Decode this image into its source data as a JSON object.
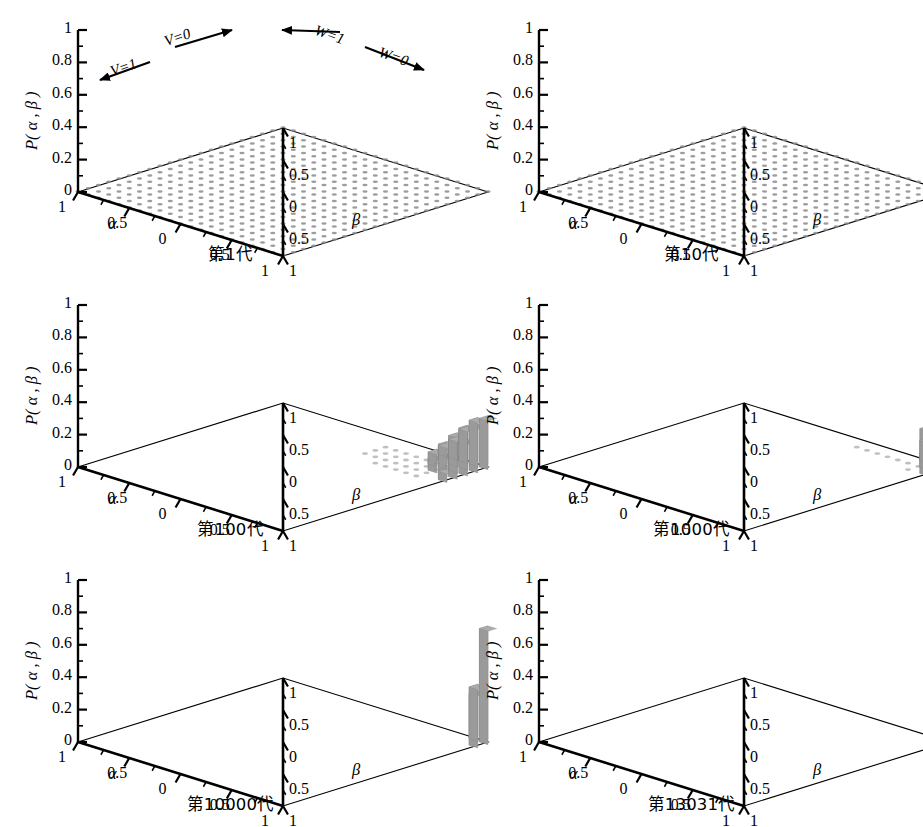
{
  "figure": {
    "type": "multi-panel-3d-surface-grid",
    "panel_count": 6,
    "columns": 2,
    "rows": 3,
    "background": "#ffffff",
    "ink_color": "#000000",
    "data_color": "#8c8c8c"
  },
  "axes": {
    "z_label": "P( α , β )",
    "z_ticks": [
      "0",
      "0.2",
      "0.4",
      "0.6",
      "0.8",
      "1"
    ],
    "z_values": [
      0,
      0.2,
      0.4,
      0.6,
      0.8,
      1
    ],
    "z_range": [
      0,
      1
    ],
    "alpha_label": "α",
    "alpha_ticks": [
      "1",
      "0.5",
      "0",
      "0.5",
      "1"
    ],
    "beta_label": "β",
    "beta_ticks": [
      "1",
      "0.5",
      "0",
      "0.5",
      "1"
    ]
  },
  "annotations": {
    "v1": "V=1",
    "v0": "V=0",
    "w1": "W=1",
    "w0": "W=0"
  },
  "panels": [
    {
      "id": "gen1",
      "caption": "第1代",
      "generation": 1,
      "has_annotations": true,
      "mode": "uniform-grid",
      "peak": 0.0
    },
    {
      "id": "gen10",
      "caption": "第10代",
      "generation": 10,
      "has_annotations": false,
      "mode": "uniform-grid",
      "peak": 0.0
    },
    {
      "id": "gen100",
      "caption": "第100代",
      "generation": 100,
      "has_annotations": false,
      "mode": "spike",
      "peak": 0.3
    },
    {
      "id": "gen1000",
      "caption": "第1000代",
      "generation": 1000,
      "has_annotations": false,
      "mode": "spike",
      "peak": 0.45
    },
    {
      "id": "gen10000",
      "caption": "第10000代",
      "generation": 10000,
      "has_annotations": false,
      "mode": "spike",
      "peak": 0.7
    },
    {
      "id": "gen13031",
      "caption": "第13031代",
      "generation": 13031,
      "has_annotations": false,
      "mode": "spike",
      "peak": 1.0
    }
  ],
  "chart_data": {
    "type": "bar",
    "title": "",
    "xlabel": "α",
    "ylabel": "β",
    "zlabel": "P( α , β )",
    "zlim": [
      0,
      1
    ],
    "xticklabels": [
      "1",
      "0.5",
      "0",
      "0.5",
      "1"
    ],
    "yticklabels": [
      "1",
      "0.5",
      "0",
      "0.5",
      "1"
    ],
    "grid": false,
    "legend": "none",
    "series": [
      {
        "name": "第1代",
        "generation": 1,
        "peak_value": 0.0,
        "peak_location": null,
        "distribution": "uniform"
      },
      {
        "name": "第10代",
        "generation": 10,
        "peak_value": 0.0,
        "peak_location": null,
        "distribution": "uniform"
      },
      {
        "name": "第100代",
        "generation": 100,
        "peak_value": 0.3,
        "peak_location": [
          1.0,
          1.0
        ],
        "distribution": "broad-corner-cluster"
      },
      {
        "name": "第1000代",
        "generation": 1000,
        "peak_value": 0.45,
        "peak_location": [
          1.0,
          1.0
        ],
        "distribution": "narrow-corner-spike"
      },
      {
        "name": "第10000代",
        "generation": 10000,
        "peak_value": 0.7,
        "peak_location": [
          1.0,
          1.0
        ],
        "distribution": "narrow-corner-spike"
      },
      {
        "name": "第13031代",
        "generation": 13031,
        "peak_value": 1.0,
        "peak_location": [
          1.0,
          1.0
        ],
        "distribution": "single-spike-converged"
      }
    ]
  }
}
